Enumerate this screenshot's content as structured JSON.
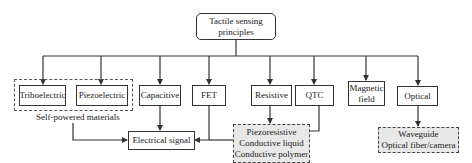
{
  "diagram": {
    "root": {
      "line1": "Tactile sensing",
      "line2": "principles"
    },
    "principles": [
      {
        "id": "triboelectric",
        "label": "Triboelectric"
      },
      {
        "id": "piezoelectric",
        "label": "Piezoelectric"
      },
      {
        "id": "capacitive",
        "label": "Capacitive"
      },
      {
        "id": "fet",
        "label": "FET"
      },
      {
        "id": "resistive",
        "label": "Resistive"
      },
      {
        "id": "qtc",
        "label": "QTC"
      },
      {
        "id": "magnetic",
        "line1": "Magnetic",
        "line2": "field"
      },
      {
        "id": "optical",
        "label": "Optical"
      }
    ],
    "group_label": "Self-powered materials",
    "electrical_signal": "Electrical signal",
    "resistive_materials": [
      "Piezoresistive",
      "Conductive liquid",
      "Conductive polymer"
    ],
    "optical_materials": [
      "Waveguide",
      "Optical fiber/camera"
    ],
    "colors": {
      "line": "#333333",
      "dashed_fill": "#e8e8e8",
      "background": "#ffffff"
    }
  }
}
